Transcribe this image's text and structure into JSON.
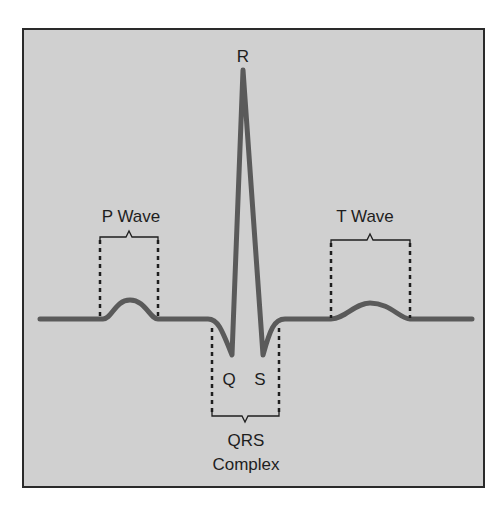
{
  "diagram": {
    "type": "ECG waveform",
    "labels": {
      "r": "R",
      "q": "Q",
      "s": "S",
      "p_wave": "P Wave",
      "t_wave": "T Wave",
      "qrs_line1": "QRS",
      "qrs_line2": "Complex"
    },
    "colors": {
      "panel_background": "#d0d0d0",
      "trace": "#5a5a5a",
      "frame": "#2a2a2a",
      "text": "#1e1e1e"
    }
  }
}
